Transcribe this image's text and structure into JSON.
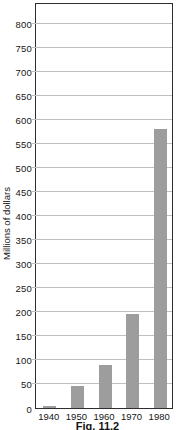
{
  "figure": {
    "caption": "Fig. 11.2"
  },
  "chart_data": {
    "type": "bar",
    "title": "",
    "xlabel": "",
    "ylabel": "Millions of dollars",
    "categories": [
      "1940",
      "1950",
      "1960",
      "1970",
      "1980"
    ],
    "values": [
      5,
      45,
      90,
      195,
      580
    ],
    "ylim": [
      0,
      845
    ],
    "ytick_min": 0,
    "ytick_max": 800,
    "ytick_step": 50,
    "grid": "horizontal",
    "legend": "none",
    "colors": {
      "bar": "#9d9d9d",
      "gridline": "#bfbfbf",
      "axis": "#2e2e2e",
      "text": "#151515",
      "background": "#ffffff"
    }
  }
}
